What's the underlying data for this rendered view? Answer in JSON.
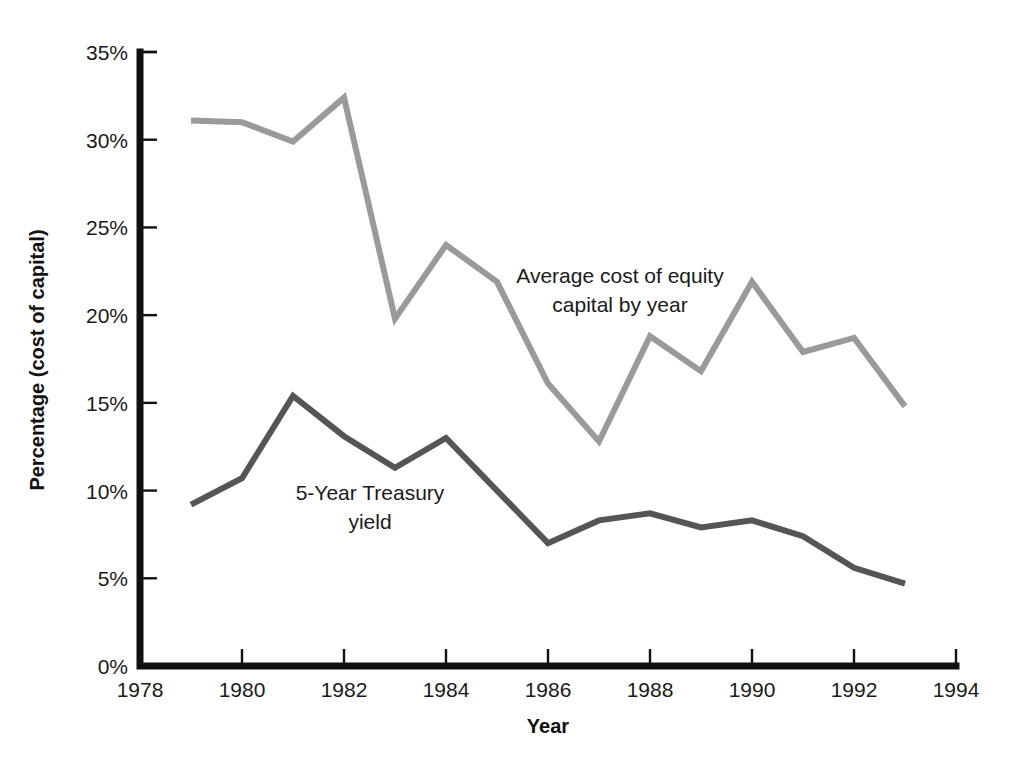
{
  "chart_data": {
    "type": "line",
    "title": "",
    "xlabel": "Year",
    "ylabel": "Percentage (cost of capital)",
    "xlim": [
      1978,
      1994
    ],
    "ylim": [
      0,
      35
    ],
    "grid": false,
    "legend_position": "inline-annotations",
    "x": [
      1979,
      1980,
      1981,
      1982,
      1983,
      1984,
      1985,
      1986,
      1987,
      1988,
      1989,
      1990,
      1991,
      1992,
      1993
    ],
    "xticks": [
      1978,
      1980,
      1982,
      1984,
      1986,
      1988,
      1990,
      1992,
      1994
    ],
    "xtick_labels": [
      "1978",
      "1980",
      "1982",
      "1984",
      "1986",
      "1988",
      "1990",
      "1992",
      "1994"
    ],
    "yticks": [
      0,
      5,
      10,
      15,
      20,
      25,
      30,
      35
    ],
    "ytick_labels": [
      "0%",
      "5%",
      "10%",
      "15%",
      "20%",
      "25%",
      "30%",
      "35%"
    ],
    "series": [
      {
        "name": "Average cost of equity capital by year",
        "color": "#9a9a9a",
        "stroke_width": 6,
        "values": [
          31.1,
          31.0,
          29.9,
          32.4,
          19.8,
          24.0,
          21.9,
          16.1,
          12.8,
          18.8,
          16.8,
          21.9,
          17.9,
          18.7,
          14.8
        ]
      },
      {
        "name": "5-Year Treasury yield",
        "color": "#555555",
        "stroke_width": 6,
        "values": [
          9.2,
          10.7,
          15.4,
          13.1,
          11.3,
          13.0,
          10.0,
          7.0,
          8.3,
          8.7,
          7.9,
          8.3,
          7.4,
          5.6,
          4.7
        ]
      }
    ],
    "annotations": [
      {
        "id": "equity-annotation",
        "lines": [
          "Average cost of equity",
          "capital by year"
        ],
        "x": 620,
        "y": 283
      },
      {
        "id": "treasury-annotation",
        "lines": [
          "5-Year Treasury",
          "yield"
        ],
        "x": 370,
        "y": 500
      }
    ]
  },
  "axes": {
    "y_title": "Percentage (cost of capital)",
    "x_title": "Year"
  }
}
